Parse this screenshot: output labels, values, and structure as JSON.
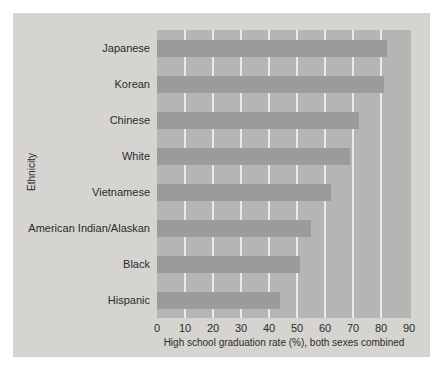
{
  "figure": {
    "page_background": "#ffffff",
    "panel_background": "#d5d4d0"
  },
  "chart_data": {
    "type": "bar",
    "orientation": "horizontal",
    "title": "",
    "xlabel": "High school graduation rate (%), both sexes combined",
    "ylabel": "Ethnicity",
    "categories": [
      "Japanese",
      "Korean",
      "Chinese",
      "White",
      "Vietnamese",
      "American Indian/Alaskan",
      "Black",
      "Hispanic"
    ],
    "values": [
      82,
      81,
      72,
      69,
      62,
      55,
      51,
      44
    ],
    "xlim": [
      0,
      90
    ],
    "xticks": [
      0,
      10,
      20,
      30,
      40,
      50,
      60,
      70,
      80,
      90
    ],
    "grid": "vertical white gridlines under bars",
    "legend": "none",
    "colors": {
      "plot_background": "#b6b5b3",
      "bar": "#9c9b99",
      "gridline": "#eceae7",
      "text": "#2b2b2b"
    }
  }
}
